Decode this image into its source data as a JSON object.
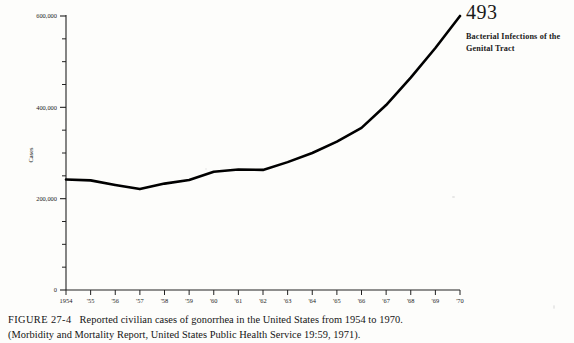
{
  "running_head": {
    "folio": "493",
    "chapter_title_line1": "Bacterial Infections of the",
    "chapter_title_line2": "Genital Tract"
  },
  "caption": {
    "figure_label": "FIGURE 27-4",
    "text": "Reported civilian cases of gonorrhea in the United States from 1954 to 1970.",
    "source": "(Morbidity and Mortality Report, United States Public Health Service 19:59, 1971)."
  },
  "chart_data": {
    "type": "line",
    "title": "",
    "xlabel": "",
    "ylabel": "Cases",
    "x": [
      1954,
      1955,
      1956,
      1957,
      1958,
      1959,
      1960,
      1961,
      1962,
      1963,
      1964,
      1965,
      1966,
      1967,
      1968,
      1969,
      1970
    ],
    "xtick_labels": [
      "1954",
      "'55",
      "'56",
      "'57",
      "'58",
      "'59",
      "'60",
      "'61",
      "'62",
      "'63",
      "'64",
      "'65",
      "'66",
      "'67",
      "'68",
      "'69",
      "'70"
    ],
    "values": [
      242000,
      240000,
      230000,
      221000,
      233000,
      241000,
      259000,
      264000,
      263000,
      280000,
      300000,
      325000,
      355000,
      405000,
      465000,
      530000,
      600000
    ],
    "ylim": [
      0,
      600000
    ],
    "ytick_major_values": [
      0,
      200000,
      400000,
      600000
    ],
    "ytick_major_labels": [
      "0",
      "200,000",
      "400,000",
      "600,000"
    ],
    "ytick_minor_step": 50000,
    "grid": false,
    "legend": false,
    "line_color": "#000000",
    "line_width": 2.6,
    "axis_color": "#222222"
  }
}
